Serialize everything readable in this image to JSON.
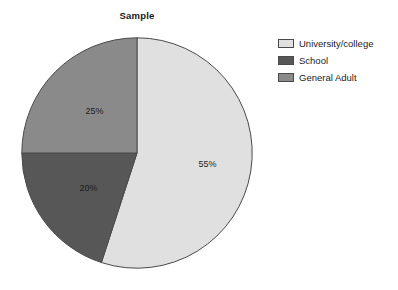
{
  "chart_data": {
    "type": "pie",
    "title": "Sample",
    "xlabel": "",
    "ylabel": "",
    "legend_position": "right",
    "grid": false,
    "start_angle_deg": 0,
    "direction": "clockwise",
    "categories": [
      "University/college",
      "School",
      "General Adult"
    ],
    "values": [
      55,
      20,
      25
    ],
    "value_unit": "%",
    "data_labels": [
      "55%",
      "20%",
      "25%"
    ],
    "colors": [
      "#e0e0e0",
      "#575757",
      "#8a8a8a"
    ],
    "slice_border_color": "#4a4a4a",
    "slices": [
      {
        "label": "University/college",
        "value": 55,
        "data_label": "55%",
        "color": "#e0e0e0"
      },
      {
        "label": "School",
        "value": 20,
        "data_label": "20%",
        "color": "#575757"
      },
      {
        "label": "General Adult",
        "value": 25,
        "data_label": "25%",
        "color": "#8a8a8a"
      }
    ]
  },
  "legend": {
    "items": [
      {
        "label": "University/college",
        "color": "#e0e0e0"
      },
      {
        "label": "School",
        "color": "#575757"
      },
      {
        "label": "General Adult",
        "color": "#8a8a8a"
      }
    ]
  },
  "canvas": {
    "background": "#ffffff",
    "text_color": "#1c1c1c"
  }
}
